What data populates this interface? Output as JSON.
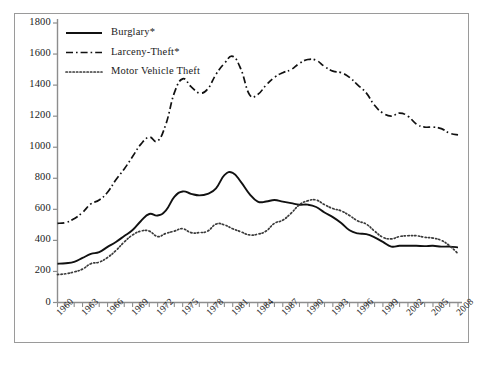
{
  "chart_data": {
    "type": "line",
    "title": "",
    "xlabel": "",
    "ylabel": "",
    "ylim": [
      0,
      1800
    ],
    "ytick_step": 200,
    "yticks": [
      "0",
      "200",
      "400",
      "600",
      "800",
      "1000",
      "1200",
      "1400",
      "1600",
      "1800"
    ],
    "xlim": [
      1960,
      2008
    ],
    "xtick_step": 3,
    "xticks": [
      "1960",
      "1963",
      "1966",
      "1969",
      "1972",
      "1975",
      "1978",
      "1981",
      "1984",
      "1987",
      "1990",
      "1993",
      "1996",
      "1999",
      "2002",
      "2005",
      "2008"
    ],
    "x": [
      1960,
      1961,
      1962,
      1963,
      1964,
      1965,
      1966,
      1967,
      1968,
      1969,
      1970,
      1971,
      1972,
      1973,
      1974,
      1975,
      1976,
      1977,
      1978,
      1979,
      1980,
      1981,
      1982,
      1983,
      1984,
      1985,
      1986,
      1987,
      1988,
      1989,
      1990,
      1991,
      1992,
      1993,
      1994,
      1995,
      1996,
      1997,
      1998,
      1999,
      2000,
      2001,
      2002,
      2003,
      2004,
      2005,
      2006,
      2007,
      2008
    ],
    "grid": false,
    "legend_position": "top-left",
    "series": [
      {
        "name": "Burglary*",
        "style": "solid",
        "color": "#111111",
        "values": [
          250,
          253,
          262,
          287,
          313,
          325,
          358,
          390,
          428,
          467,
          525,
          570,
          560,
          593,
          680,
          715,
          700,
          690,
          700,
          735,
          820,
          835,
          775,
          700,
          650,
          650,
          660,
          650,
          640,
          630,
          630,
          615,
          580,
          550,
          512,
          465,
          445,
          440,
          420,
          390,
          360,
          365,
          365,
          365,
          363,
          365,
          360,
          360,
          355
        ]
      },
      {
        "name": "Larceny-Theft*",
        "style": "dashdot",
        "color": "#111111",
        "values": [
          510,
          515,
          540,
          580,
          635,
          660,
          710,
          790,
          860,
          940,
          1020,
          1065,
          1040,
          1150,
          1350,
          1440,
          1390,
          1350,
          1375,
          1470,
          1540,
          1585,
          1500,
          1340,
          1340,
          1400,
          1450,
          1480,
          1500,
          1540,
          1565,
          1560,
          1520,
          1490,
          1480,
          1450,
          1400,
          1350,
          1270,
          1220,
          1200,
          1220,
          1200,
          1150,
          1130,
          1130,
          1120,
          1090,
          1080
        ]
      },
      {
        "name": "Motor Vehicle Theft",
        "style": "dotted",
        "color": "#3a3a3a",
        "values": [
          180,
          185,
          197,
          215,
          250,
          260,
          290,
          335,
          390,
          435,
          460,
          460,
          425,
          445,
          460,
          475,
          450,
          450,
          460,
          505,
          500,
          475,
          455,
          435,
          440,
          460,
          510,
          530,
          575,
          630,
          655,
          660,
          630,
          605,
          590,
          560,
          525,
          505,
          460,
          420,
          410,
          425,
          430,
          430,
          420,
          415,
          400,
          365,
          315
        ]
      }
    ]
  }
}
